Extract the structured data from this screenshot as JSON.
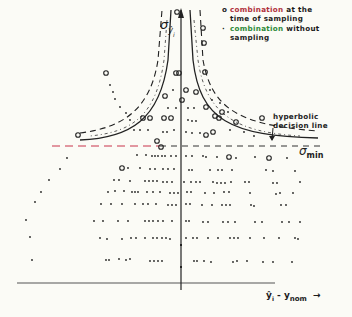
{
  "figure": {
    "y_axis_label": "σ",
    "y_axis_sub": "ŷ",
    "y_axis_subsub": "i",
    "x_axis_label_main": "ŷ",
    "x_axis_label_i": "i",
    "x_axis_label_rest": " - y",
    "x_axis_label_nom": "nom",
    "x_axis_arrow": "→",
    "sigma_min_label": "σ",
    "sigma_min_sub": "min",
    "decision_line_label_1": "hyperbolic",
    "decision_line_label_2": "decision line"
  },
  "legend": {
    "items": [
      {
        "symbol": "o",
        "line1_a": "combination",
        "line1_b": " at the",
        "line2": "time of sampling",
        "accent": "#b0303c"
      },
      {
        "symbol": "·",
        "line1_a": "combination",
        "line1_b": " without",
        "line2": "sampling",
        "accent": "#2e8a3a"
      }
    ]
  },
  "colors": {
    "ink": "#1c1c1c",
    "paper": "#fbfbf6",
    "red_dash": "#c8324a"
  }
}
